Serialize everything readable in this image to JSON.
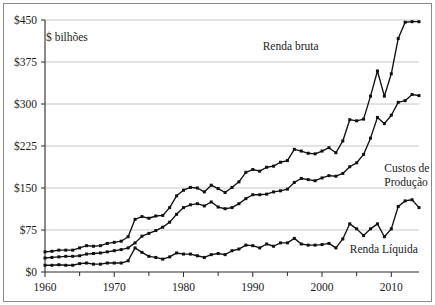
{
  "chart_data": {
    "type": "line",
    "title": "",
    "unit_label": "$ bilhões",
    "xlabel": "",
    "ylabel": "",
    "xlim": [
      1960,
      2014
    ],
    "ylim": [
      0,
      450
    ],
    "yticks": [
      0,
      75,
      150,
      225,
      300,
      375,
      450
    ],
    "ytick_labels": [
      "$0",
      "$75",
      "$150",
      "$225",
      "$300",
      "$375",
      "$450"
    ],
    "xticks": [
      1960,
      1970,
      1980,
      1990,
      2000,
      2010
    ],
    "xtick_labels": [
      "1960",
      "1970",
      "1980",
      "1990",
      "2000",
      "2010"
    ],
    "xminor_ticks": [
      1965,
      1975,
      1985,
      1995,
      2005
    ],
    "grid": "horizontal",
    "legend_position": "inline-annotations",
    "x": [
      1960,
      1961,
      1962,
      1963,
      1964,
      1965,
      1966,
      1967,
      1968,
      1969,
      1970,
      1971,
      1972,
      1973,
      1974,
      1975,
      1976,
      1977,
      1978,
      1979,
      1980,
      1981,
      1982,
      1983,
      1984,
      1985,
      1986,
      1987,
      1988,
      1989,
      1990,
      1991,
      1992,
      1993,
      1994,
      1995,
      1996,
      1997,
      1998,
      1999,
      2000,
      2001,
      2002,
      2003,
      2004,
      2005,
      2006,
      2007,
      2008,
      2009,
      2010,
      2011,
      2012,
      2013,
      2014
    ],
    "series": [
      {
        "name": "Renda bruta",
        "color": "#111111",
        "label_x": 1999.5,
        "label_y": 397,
        "label_anchor": "end",
        "values": [
          36,
          37,
          39,
          39,
          39,
          43,
          47,
          46,
          47,
          51,
          53,
          55,
          63,
          94,
          99,
          96,
          100,
          101,
          115,
          136,
          146,
          151,
          150,
          143,
          155,
          149,
          142,
          151,
          161,
          178,
          183,
          180,
          187,
          189,
          196,
          199,
          219,
          216,
          212,
          211,
          216,
          222,
          213,
          234,
          272,
          270,
          273,
          314,
          359,
          314,
          354,
          417,
          446,
          447,
          447
        ]
      },
      {
        "name": "Custos de Produção",
        "color": "#111111",
        "label_x": 2009.0,
        "label_y": 178,
        "label_anchor": "start",
        "values": [
          25,
          26,
          27,
          28,
          28,
          29,
          32,
          33,
          34,
          36,
          38,
          40,
          43,
          52,
          64,
          69,
          74,
          80,
          89,
          103,
          115,
          120,
          122,
          118,
          125,
          116,
          113,
          115,
          122,
          131,
          138,
          138,
          139,
          143,
          145,
          148,
          160,
          167,
          165,
          163,
          168,
          172,
          171,
          176,
          188,
          195,
          210,
          239,
          276,
          265,
          280,
          303,
          306,
          317,
          315
        ]
      },
      {
        "name": "Renda Líquida",
        "color": "#111111",
        "label_x": 2004.0,
        "label_y": 34,
        "label_anchor": "start",
        "values": [
          12,
          12,
          13,
          12,
          12,
          15,
          16,
          14,
          14,
          16,
          16,
          16,
          20,
          43,
          35,
          28,
          26,
          23,
          27,
          34,
          32,
          32,
          29,
          26,
          31,
          33,
          31,
          38,
          41,
          48,
          47,
          43,
          50,
          46,
          52,
          52,
          60,
          50,
          48,
          48,
          49,
          51,
          43,
          59,
          86,
          77,
          65,
          77,
          86,
          63,
          77,
          117,
          127,
          129,
          115
        ]
      }
    ]
  }
}
